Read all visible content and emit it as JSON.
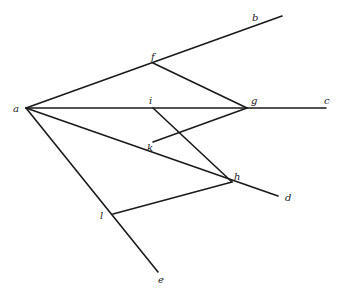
{
  "diagram": {
    "type": "geometric-construction",
    "points": {
      "a": {
        "x": 26,
        "y": 108,
        "label": "a",
        "lx": 13,
        "ly": 112
      },
      "b": {
        "x": 282,
        "y": 16,
        "label": "b",
        "lx": 252,
        "ly": 21
      },
      "c": {
        "x": 326,
        "y": 108,
        "label": "c",
        "lx": 324,
        "ly": 104
      },
      "d": {
        "x": 278,
        "y": 196,
        "label": "d",
        "lx": 285,
        "ly": 201
      },
      "e": {
        "x": 158,
        "y": 272,
        "label": "e",
        "lx": 158,
        "ly": 283
      },
      "f": {
        "x": 153,
        "y": 63,
        "label": "f",
        "lx": 151,
        "ly": 60
      },
      "g": {
        "x": 247,
        "y": 108,
        "label": "g",
        "lx": 251,
        "ly": 104
      },
      "i": {
        "x": 153,
        "y": 108,
        "label": "i",
        "lx": 149,
        "ly": 104
      },
      "k": {
        "x": 153,
        "y": 142,
        "label": "k",
        "lx": 147,
        "ly": 151
      },
      "h": {
        "x": 232,
        "y": 182,
        "label": "h",
        "lx": 234,
        "ly": 180
      },
      "l": {
        "x": 113,
        "y": 214,
        "label": "l",
        "lx": 100,
        "ly": 219
      }
    },
    "segments": [
      {
        "id": "ab",
        "from": "a",
        "to": "b"
      },
      {
        "id": "ac",
        "from": "a",
        "to": "c"
      },
      {
        "id": "ad",
        "from": "a",
        "to": "d"
      },
      {
        "id": "ae",
        "from": "a",
        "to": "e"
      },
      {
        "id": "fg",
        "from": "f",
        "to": "g"
      },
      {
        "id": "ih",
        "from": "i",
        "to": "h"
      },
      {
        "id": "kg",
        "from": "k",
        "to": "g"
      },
      {
        "id": "lh",
        "from": "l",
        "to": "h"
      }
    ],
    "stroke_color": "#1a1a1a",
    "background": "#ffffff"
  }
}
